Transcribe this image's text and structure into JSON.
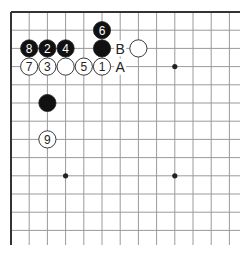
{
  "diagram": {
    "type": "go-board-partial",
    "corner": "top-left",
    "grid": {
      "origin_x": 11,
      "origin_y": 12,
      "spacing": 18.2,
      "cols": 13,
      "rows": 13,
      "right_extent": 240,
      "bottom_extent": 245
    },
    "hoshi": [
      {
        "col": 9,
        "row": 3
      },
      {
        "col": 3,
        "row": 9
      },
      {
        "col": 9,
        "row": 9
      }
    ],
    "stones": [
      {
        "color": "black",
        "col": 5,
        "row": 1,
        "label": "6"
      },
      {
        "color": "black",
        "col": 1,
        "row": 2,
        "label": "8"
      },
      {
        "color": "black",
        "col": 2,
        "row": 2,
        "label": "2"
      },
      {
        "color": "black",
        "col": 3,
        "row": 2,
        "label": "4"
      },
      {
        "color": "black",
        "col": 5,
        "row": 2,
        "label": ""
      },
      {
        "color": "white",
        "col": 7,
        "row": 2,
        "label": ""
      },
      {
        "color": "white",
        "col": 1,
        "row": 3,
        "label": "7"
      },
      {
        "color": "white",
        "col": 2,
        "row": 3,
        "label": "3"
      },
      {
        "color": "white",
        "col": 3,
        "row": 3,
        "label": ""
      },
      {
        "color": "white",
        "col": 4,
        "row": 3,
        "label": "5"
      },
      {
        "color": "white",
        "col": 5,
        "row": 3,
        "label": "1"
      },
      {
        "color": "black",
        "col": 2,
        "row": 5,
        "label": ""
      },
      {
        "color": "white",
        "col": 2,
        "row": 7,
        "label": "9"
      }
    ],
    "markers": [
      {
        "col": 6,
        "row": 2,
        "text": "B"
      },
      {
        "col": 6,
        "row": 3,
        "text": "A"
      }
    ],
    "colors": {
      "black_stone": "#111111",
      "white_stone": "#ffffff",
      "line": "#9a9a9a",
      "edge": "#333333"
    }
  }
}
